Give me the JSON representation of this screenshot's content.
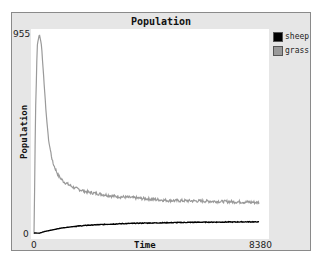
{
  "chart_data": {
    "type": "line",
    "title": "Population",
    "xlabel": "Time",
    "ylabel": "Population",
    "xlim": [
      0,
      8380
    ],
    "ylim": [
      0,
      955
    ],
    "x_tick_labels": [
      "0",
      "8380"
    ],
    "y_tick_labels": [
      "0",
      "955"
    ],
    "grid": false,
    "legend_position": "right-top",
    "series": [
      {
        "name": "sheep",
        "color": "#000000",
        "x": [
          0,
          200,
          400,
          700,
          1000,
          1500,
          2000,
          3000,
          4000,
          5000,
          6000,
          7000,
          8000,
          8380
        ],
        "values": [
          5,
          4,
          12,
          20,
          28,
          36,
          42,
          48,
          52,
          54,
          56,
          57,
          58,
          58
        ]
      },
      {
        "name": "grass",
        "color": "#9a9a9a",
        "x": [
          0,
          60,
          120,
          200,
          280,
          360,
          450,
          550,
          700,
          900,
          1100,
          1500,
          2000,
          3000,
          4000,
          5000,
          6000,
          7000,
          8000,
          8380
        ],
        "values": [
          0,
          600,
          900,
          955,
          900,
          750,
          580,
          440,
          340,
          280,
          250,
          220,
          200,
          180,
          170,
          160,
          158,
          155,
          152,
          150
        ]
      }
    ]
  },
  "legend": {
    "items": [
      {
        "label": "sheep",
        "color": "#000000"
      },
      {
        "label": "grass",
        "color": "#9a9a9a"
      }
    ]
  },
  "axes": {
    "y_max_label": "955",
    "y_min_label": "0",
    "x_min_label": "0",
    "x_max_label": "8380"
  }
}
